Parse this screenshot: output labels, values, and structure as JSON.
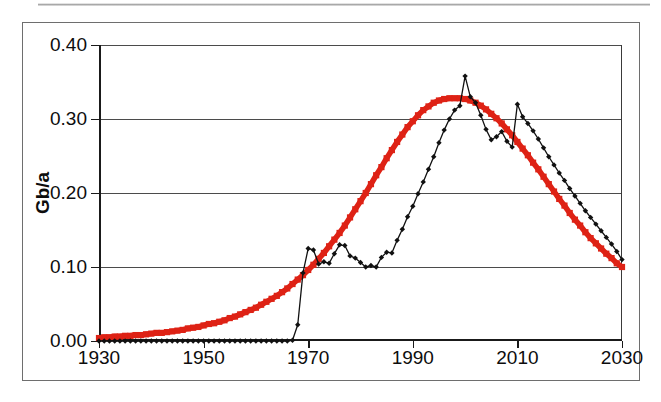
{
  "figure": {
    "caption": "",
    "y_axis_title": "Gb/a"
  },
  "axes": {
    "y_ticks": [
      "0.00",
      "0.10",
      "0.20",
      "0.30",
      "0.40"
    ],
    "x_ticks": [
      "1930",
      "1950",
      "1970",
      "1990",
      "2010",
      "2030"
    ]
  },
  "colors": {
    "model_curve": "#DE2215",
    "data_curve": "#111111",
    "gridline": "#4b4b4b",
    "frame": "#6e6e6e",
    "background": "#ffffff"
  },
  "chart_data": {
    "type": "line",
    "title": "",
    "xlabel": "",
    "ylabel": "Gb/a",
    "xlim": [
      1930,
      2030
    ],
    "ylim": [
      0.0,
      0.4
    ],
    "xtick_step": 20,
    "ytick_step": 0.1,
    "grid": true,
    "legend": "none",
    "series": [
      {
        "name": "model-curve",
        "style": "thick-square-markers",
        "color": "#DE2215",
        "x": [
          1930,
          1931,
          1932,
          1933,
          1934,
          1935,
          1936,
          1937,
          1938,
          1939,
          1940,
          1941,
          1942,
          1943,
          1944,
          1945,
          1946,
          1947,
          1948,
          1949,
          1950,
          1951,
          1952,
          1953,
          1954,
          1955,
          1956,
          1957,
          1958,
          1959,
          1960,
          1961,
          1962,
          1963,
          1964,
          1965,
          1966,
          1967,
          1968,
          1969,
          1970,
          1971,
          1972,
          1973,
          1974,
          1975,
          1976,
          1977,
          1978,
          1979,
          1980,
          1981,
          1982,
          1983,
          1984,
          1985,
          1986,
          1987,
          1988,
          1989,
          1990,
          1991,
          1992,
          1993,
          1994,
          1995,
          1996,
          1997,
          1998,
          1999,
          2000,
          2001,
          2002,
          2003,
          2004,
          2005,
          2006,
          2007,
          2008,
          2009,
          2010,
          2011,
          2012,
          2013,
          2014,
          2015,
          2016,
          2017,
          2018,
          2019,
          2020,
          2021,
          2022,
          2023,
          2024,
          2025,
          2026,
          2027,
          2028,
          2029,
          2030
        ],
        "values": [
          0.004,
          0.005,
          0.005,
          0.006,
          0.006,
          0.007,
          0.007,
          0.008,
          0.008,
          0.009,
          0.01,
          0.011,
          0.011,
          0.012,
          0.013,
          0.014,
          0.015,
          0.017,
          0.018,
          0.019,
          0.021,
          0.023,
          0.024,
          0.026,
          0.028,
          0.031,
          0.033,
          0.036,
          0.039,
          0.042,
          0.045,
          0.049,
          0.053,
          0.057,
          0.061,
          0.066,
          0.071,
          0.077,
          0.083,
          0.089,
          0.096,
          0.103,
          0.111,
          0.119,
          0.128,
          0.137,
          0.146,
          0.156,
          0.167,
          0.178,
          0.189,
          0.2,
          0.212,
          0.224,
          0.235,
          0.247,
          0.258,
          0.269,
          0.279,
          0.289,
          0.297,
          0.305,
          0.312,
          0.317,
          0.322,
          0.325,
          0.327,
          0.328,
          0.328,
          0.328,
          0.327,
          0.325,
          0.322,
          0.318,
          0.313,
          0.307,
          0.301,
          0.294,
          0.286,
          0.278,
          0.269,
          0.26,
          0.251,
          0.241,
          0.232,
          0.222,
          0.212,
          0.202,
          0.192,
          0.183,
          0.173,
          0.164,
          0.156,
          0.147,
          0.139,
          0.132,
          0.125,
          0.118,
          0.112,
          0.105,
          0.1
        ]
      },
      {
        "name": "data-curve",
        "style": "thin-line-diamond-markers",
        "color": "#111111",
        "x": [
          1930,
          1931,
          1932,
          1933,
          1934,
          1935,
          1936,
          1937,
          1938,
          1939,
          1940,
          1941,
          1942,
          1943,
          1944,
          1945,
          1946,
          1947,
          1948,
          1949,
          1950,
          1951,
          1952,
          1953,
          1954,
          1955,
          1956,
          1957,
          1958,
          1959,
          1960,
          1961,
          1962,
          1963,
          1964,
          1965,
          1966,
          1967,
          1968,
          1969,
          1970,
          1971,
          1972,
          1973,
          1974,
          1975,
          1976,
          1977,
          1978,
          1979,
          1980,
          1981,
          1982,
          1983,
          1984,
          1985,
          1986,
          1987,
          1988,
          1989,
          1990,
          1991,
          1992,
          1993,
          1994,
          1995,
          1996,
          1997,
          1998,
          1999,
          2000,
          2001,
          2002,
          2003,
          2004,
          2005,
          2006,
          2007,
          2008,
          2009,
          2010,
          2011,
          2012,
          2013,
          2014,
          2015,
          2016,
          2017,
          2018,
          2019,
          2020,
          2021,
          2022,
          2023,
          2024,
          2025,
          2026,
          2027,
          2028,
          2029,
          2030
        ],
        "values": [
          0.0,
          0.0,
          0.0,
          0.0,
          0.0,
          0.0,
          0.0,
          0.0,
          0.0,
          0.0,
          0.0,
          0.0,
          0.0,
          0.0,
          0.0,
          0.0,
          0.0,
          0.0,
          0.0,
          0.0,
          0.0,
          0.0,
          0.0,
          0.0,
          0.0,
          0.0,
          0.0,
          0.0,
          0.0,
          0.0,
          0.0,
          0.0,
          0.0,
          0.0,
          0.0,
          0.0,
          0.0,
          0.001,
          0.022,
          0.092,
          0.125,
          0.123,
          0.104,
          0.107,
          0.105,
          0.118,
          0.13,
          0.129,
          0.115,
          0.112,
          0.106,
          0.1,
          0.102,
          0.1,
          0.113,
          0.12,
          0.119,
          0.136,
          0.151,
          0.168,
          0.182,
          0.199,
          0.215,
          0.232,
          0.249,
          0.268,
          0.285,
          0.3,
          0.312,
          0.318,
          0.358,
          0.33,
          0.322,
          0.305,
          0.286,
          0.272,
          0.276,
          0.283,
          0.27,
          0.262,
          0.32,
          0.303,
          0.294,
          0.284,
          0.273,
          0.261,
          0.249,
          0.238,
          0.227,
          0.217,
          0.206,
          0.196,
          0.186,
          0.176,
          0.167,
          0.158,
          0.149,
          0.14,
          0.131,
          0.121,
          0.11
        ]
      }
    ]
  }
}
